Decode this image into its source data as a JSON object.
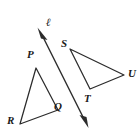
{
  "figure": {
    "background_color": "#ffffff",
    "stroke_color": "#2b2b2b",
    "label_color": "#1a1a1a",
    "width": 140,
    "height": 138,
    "line": {
      "name": "line-ell",
      "label": "ℓ",
      "label_x": 46,
      "label_y": 17,
      "start_x": 38,
      "start_y": 28,
      "end_x": 88,
      "end_y": 127,
      "arrow_start": true,
      "arrow_end": true
    },
    "triangles": [
      {
        "name": "triangle-pqr",
        "label": "PQR",
        "vertices": [
          {
            "label": "P",
            "x": 36,
            "y": 68,
            "label_x": 27,
            "label_y": 49
          },
          {
            "label": "Q",
            "x": 58,
            "y": 110,
            "label_x": 54,
            "label_y": 101
          },
          {
            "label": "R",
            "x": 20,
            "y": 124,
            "label_x": 7,
            "label_y": 115
          }
        ]
      },
      {
        "name": "triangle-stu",
        "label": "STU",
        "vertices": [
          {
            "label": "S",
            "x": 70,
            "y": 49,
            "label_x": 61,
            "label_y": 38
          },
          {
            "label": "U",
            "x": 124,
            "y": 75,
            "label_x": 128,
            "label_y": 68
          },
          {
            "label": "T",
            "x": 90,
            "y": 89,
            "label_x": 84,
            "label_y": 93
          }
        ]
      }
    ]
  }
}
